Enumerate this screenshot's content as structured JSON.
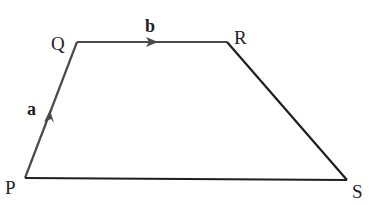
{
  "diagram": {
    "type": "trapezium",
    "vertices": [
      {
        "id": "P",
        "label": "P",
        "x": 25,
        "y": 178
      },
      {
        "id": "Q",
        "label": "Q",
        "x": 77,
        "y": 42
      },
      {
        "id": "R",
        "label": "R",
        "x": 227,
        "y": 42
      },
      {
        "id": "S",
        "label": "S",
        "x": 347,
        "y": 180
      }
    ],
    "vectors": [
      {
        "from": "P",
        "to": "Q",
        "label": "a"
      },
      {
        "from": "Q",
        "to": "R",
        "label": "b"
      }
    ],
    "colors": {
      "line": "#2a2a2a",
      "vector": "#4a4a4a",
      "text": "#222222"
    }
  }
}
